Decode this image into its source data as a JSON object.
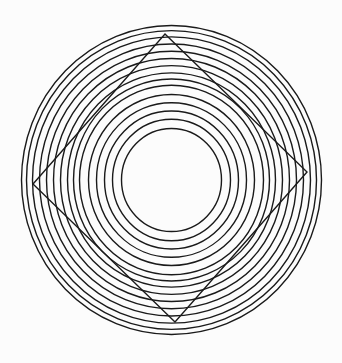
{
  "figure": {
    "kind": "optical-illusion",
    "background": "#fcfcfc",
    "stroke_color": "#1a1a1a",
    "circles": {
      "center": [
        171.5,
        180
      ],
      "y_scale": 1.03,
      "radii": [
        50,
        59,
        67,
        75,
        83,
        92,
        98,
        104,
        111,
        118,
        125,
        132,
        139,
        145,
        150
      ],
      "stroke_width": 1.4
    },
    "diamond": {
      "points": [
        [
          165,
          34
        ],
        [
          307,
          172
        ],
        [
          175,
          322
        ],
        [
          33,
          184
        ]
      ],
      "stroke_width": 1.4
    }
  }
}
